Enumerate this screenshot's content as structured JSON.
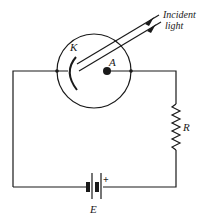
{
  "diagram": {
    "type": "photoelectric-cell-circuit",
    "labels": {
      "cathode": "K",
      "anode": "A",
      "resistor": "R",
      "battery": "E",
      "battery_polarity": "+",
      "incident_line1": "Incident",
      "incident_line2": "light"
    },
    "components": [
      {
        "id": "phototube",
        "kind": "vacuum-tube"
      },
      {
        "id": "cathode",
        "label": "K",
        "kind": "curved-electrode"
      },
      {
        "id": "anode",
        "label": "A",
        "kind": "dot-electrode"
      },
      {
        "id": "resistor",
        "label": "R",
        "kind": "resistor"
      },
      {
        "id": "battery",
        "label": "E",
        "kind": "battery",
        "polarity": "+"
      },
      {
        "id": "light",
        "label": "Incident light",
        "kind": "arrows"
      }
    ],
    "colors": {
      "ink": "#1a1a1a",
      "background": "#ffffff"
    }
  }
}
